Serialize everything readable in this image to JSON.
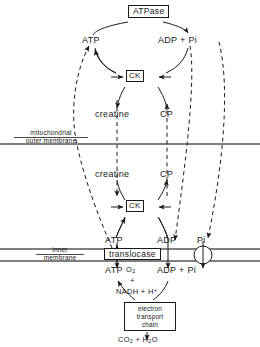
{
  "diagram": {
    "nodes": {
      "atpase": "ATPase",
      "ck_cyto": "CK",
      "ck_mito": "CK",
      "translocase": "translocase",
      "atp_cyto": "ATP",
      "adp_pi_cyto": "ADP + Pi",
      "creatine_cyto": "creatine",
      "cp_cyto": "CP",
      "creatine_mito": "creatine",
      "cp_mito": "CP",
      "atp_inner_top": "ATP",
      "adp_inner_top": "ADP",
      "pi_inner_top": "Pi",
      "atp_matrix": "ATP",
      "adp_pi_matrix": "ADP + Pi",
      "o2": "O",
      "o2_sub": "2",
      "plus": "+",
      "nadh": "NADH + H",
      "nadh_sup": "+",
      "etc_line1": "electron",
      "etc_line2": "transport",
      "etc_line3": "chain",
      "co2_h2o_pre": "CO",
      "co2_sub": "2",
      "co2_mid": " + H",
      "h2o_sub": "2",
      "h2o_post": "O"
    },
    "membranes": {
      "outer_label_line1": "mitochondrial",
      "outer_label_line2": "outer membrane",
      "inner_label_line1": "inner",
      "inner_label_line2": "membrane"
    },
    "colors": {
      "stroke": "#1a1a1a",
      "membrane": "#555555",
      "background": "#ffffff"
    }
  }
}
